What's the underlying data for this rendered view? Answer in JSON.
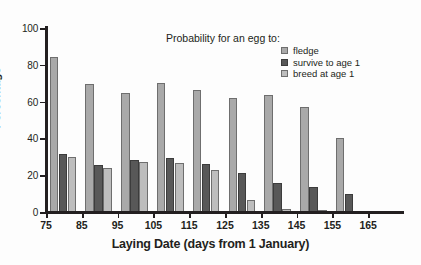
{
  "chart_data": {
    "type": "bar",
    "title": "",
    "xlabel": "Laying Date (days from 1 January)",
    "ylabel": "Percentage",
    "legend_title": "Probability for an egg to:",
    "legend_position": "top-right",
    "grid": false,
    "categories": [
      "75",
      "85",
      "95",
      "105",
      "115",
      "125",
      "135",
      "145",
      "155",
      "165"
    ],
    "group_starts": [
      75,
      85,
      95,
      105,
      115,
      125,
      135,
      145,
      155,
      165
    ],
    "xlim": [
      75,
      165
    ],
    "xticks": [
      "75",
      "85",
      "95",
      "105",
      "115",
      "125",
      "135",
      "145",
      "155",
      "165"
    ],
    "ylim": [
      0,
      100
    ],
    "yticks": [
      "0",
      "20",
      "40",
      "60",
      "80",
      "100"
    ],
    "series": [
      {
        "name": "fledge",
        "color": "#a9a9a9",
        "values": [
          84.5,
          69.5,
          64.5,
          70.0,
          66.5,
          62.0,
          63.5,
          57.0,
          40.0,
          0
        ]
      },
      {
        "name": "survive to age 1",
        "color": "#585858",
        "values": [
          31.5,
          25.5,
          28.5,
          29.5,
          26.0,
          21.0,
          16.0,
          13.5,
          10.0,
          0
        ]
      },
      {
        "name": "breed at age 1",
        "color": "#bdbdbd",
        "values": [
          30.0,
          24.0,
          27.0,
          26.5,
          23.0,
          6.5,
          1.5,
          0.8,
          0,
          0
        ]
      }
    ]
  },
  "axes": {
    "y_label": "Percentage",
    "x_label": "Laying Date (days from 1 January)"
  }
}
